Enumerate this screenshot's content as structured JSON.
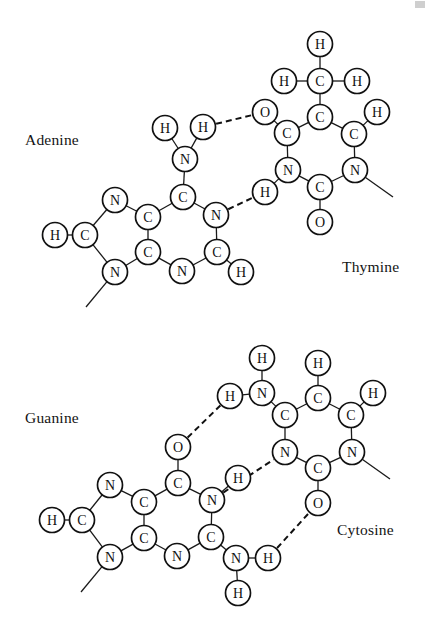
{
  "figure": {
    "background_color": "#ffffff",
    "atom_color": "#111111",
    "bond_color": "#1a1a1a",
    "width": 428,
    "height": 621
  },
  "labels": [
    {
      "id": "adenine-label",
      "text": "Adenine",
      "x": 25,
      "y": 131
    },
    {
      "id": "thymine-label",
      "text": "Thymine",
      "x": 342,
      "y": 258
    },
    {
      "id": "guanine-label",
      "text": "Guanine",
      "x": 25,
      "y": 409
    },
    {
      "id": "cytosine-label",
      "text": "Cytosine",
      "x": 337,
      "y": 521
    }
  ],
  "pairs": [
    {
      "id": "adenine-thymine",
      "name": "Adenine-Thymine base pair",
      "left_base": "Adenine",
      "right_base": "Thymine",
      "hydrogen_bonds": 2
    },
    {
      "id": "guanine-cytosine",
      "name": "Guanine-Cytosine base pair",
      "left_base": "Guanine",
      "right_base": "Cytosine",
      "hydrogen_bonds": 3
    }
  ],
  "chart_data": {
    "type": "diagram",
    "atoms": [
      {
        "id": "a_h8",
        "element": "H",
        "x": 55,
        "y": 235,
        "base": "adenine"
      },
      {
        "id": "a_c8",
        "element": "C",
        "x": 85,
        "y": 235,
        "base": "adenine"
      },
      {
        "id": "a_n7",
        "element": "N",
        "x": 115,
        "y": 200,
        "base": "adenine"
      },
      {
        "id": "a_n9",
        "element": "N",
        "x": 115,
        "y": 272,
        "base": "adenine"
      },
      {
        "id": "a_c5",
        "element": "C",
        "x": 148,
        "y": 217,
        "base": "adenine"
      },
      {
        "id": "a_c4",
        "element": "C",
        "x": 148,
        "y": 252,
        "base": "adenine"
      },
      {
        "id": "a_c6",
        "element": "C",
        "x": 183,
        "y": 197,
        "base": "adenine"
      },
      {
        "id": "a_n1",
        "element": "N",
        "x": 216,
        "y": 215,
        "base": "adenine"
      },
      {
        "id": "a_c2",
        "element": "C",
        "x": 217,
        "y": 252,
        "base": "adenine"
      },
      {
        "id": "a_n3",
        "element": "N",
        "x": 182,
        "y": 271,
        "base": "adenine"
      },
      {
        "id": "a_h2",
        "element": "H",
        "x": 241,
        "y": 272,
        "base": "adenine"
      },
      {
        "id": "a_n6",
        "element": "N",
        "x": 185,
        "y": 159,
        "base": "adenine"
      },
      {
        "id": "a_h6a",
        "element": "H",
        "x": 165,
        "y": 128,
        "base": "adenine"
      },
      {
        "id": "a_h6b",
        "element": "H",
        "x": 203,
        "y": 127,
        "base": "adenine"
      },
      {
        "id": "t_hme",
        "element": "H",
        "x": 320,
        "y": 44,
        "base": "thymine"
      },
      {
        "id": "t_cme",
        "element": "C",
        "x": 320,
        "y": 81,
        "base": "thymine"
      },
      {
        "id": "t_hml",
        "element": "H",
        "x": 284,
        "y": 81,
        "base": "thymine"
      },
      {
        "id": "t_hmr",
        "element": "H",
        "x": 357,
        "y": 81,
        "base": "thymine"
      },
      {
        "id": "t_c5",
        "element": "C",
        "x": 320,
        "y": 117,
        "base": "thymine"
      },
      {
        "id": "t_c4",
        "element": "C",
        "x": 287,
        "y": 133,
        "base": "thymine"
      },
      {
        "id": "t_o4",
        "element": "O",
        "x": 265,
        "y": 112,
        "base": "thymine"
      },
      {
        "id": "t_n3",
        "element": "N",
        "x": 288,
        "y": 170,
        "base": "thymine"
      },
      {
        "id": "t_h3",
        "element": "H",
        "x": 265,
        "y": 192,
        "base": "thymine"
      },
      {
        "id": "t_c2",
        "element": "C",
        "x": 320,
        "y": 187,
        "base": "thymine"
      },
      {
        "id": "t_o2",
        "element": "O",
        "x": 320,
        "y": 222,
        "base": "thymine"
      },
      {
        "id": "t_n1",
        "element": "N",
        "x": 355,
        "y": 170,
        "base": "thymine"
      },
      {
        "id": "t_c6",
        "element": "C",
        "x": 354,
        "y": 134,
        "base": "thymine"
      },
      {
        "id": "t_h6",
        "element": "H",
        "x": 377,
        "y": 112,
        "base": "thymine"
      },
      {
        "id": "g_h8",
        "element": "H",
        "x": 52,
        "y": 520,
        "base": "guanine"
      },
      {
        "id": "g_c8",
        "element": "C",
        "x": 82,
        "y": 520,
        "base": "guanine"
      },
      {
        "id": "g_n7",
        "element": "N",
        "x": 110,
        "y": 485,
        "base": "guanine"
      },
      {
        "id": "g_n9",
        "element": "N",
        "x": 110,
        "y": 557,
        "base": "guanine"
      },
      {
        "id": "g_c5",
        "element": "C",
        "x": 144,
        "y": 502,
        "base": "guanine"
      },
      {
        "id": "g_c4",
        "element": "C",
        "x": 144,
        "y": 538,
        "base": "guanine"
      },
      {
        "id": "g_c6",
        "element": "C",
        "x": 178,
        "y": 483,
        "base": "guanine"
      },
      {
        "id": "g_o6",
        "element": "O",
        "x": 178,
        "y": 447,
        "base": "guanine"
      },
      {
        "id": "g_n1",
        "element": "N",
        "x": 212,
        "y": 500,
        "base": "guanine"
      },
      {
        "id": "g_h1",
        "element": "H",
        "x": 238,
        "y": 478,
        "base": "guanine"
      },
      {
        "id": "g_c2",
        "element": "C",
        "x": 211,
        "y": 537,
        "base": "guanine"
      },
      {
        "id": "g_n3",
        "element": "N",
        "x": 177,
        "y": 556,
        "base": "guanine"
      },
      {
        "id": "g_n2",
        "element": "N",
        "x": 236,
        "y": 558,
        "base": "guanine"
      },
      {
        "id": "g_h2a",
        "element": "H",
        "x": 268,
        "y": 558,
        "base": "guanine"
      },
      {
        "id": "g_h2b",
        "element": "H",
        "x": 238,
        "y": 593,
        "base": "guanine"
      },
      {
        "id": "c_h4a",
        "element": "H",
        "x": 230,
        "y": 396,
        "base": "cytosine"
      },
      {
        "id": "c_n4",
        "element": "N",
        "x": 262,
        "y": 393,
        "base": "cytosine"
      },
      {
        "id": "c_h4b",
        "element": "H",
        "x": 262,
        "y": 358,
        "base": "cytosine"
      },
      {
        "id": "c_c4",
        "element": "C",
        "x": 285,
        "y": 415,
        "base": "cytosine"
      },
      {
        "id": "c_c5",
        "element": "C",
        "x": 318,
        "y": 398,
        "base": "cytosine"
      },
      {
        "id": "c_h5",
        "element": "H",
        "x": 318,
        "y": 363,
        "base": "cytosine"
      },
      {
        "id": "c_c6",
        "element": "C",
        "x": 351,
        "y": 415,
        "base": "cytosine"
      },
      {
        "id": "c_h6",
        "element": "H",
        "x": 373,
        "y": 393,
        "base": "cytosine"
      },
      {
        "id": "c_n1",
        "element": "N",
        "x": 352,
        "y": 452,
        "base": "cytosine"
      },
      {
        "id": "c_n3",
        "element": "N",
        "x": 285,
        "y": 452,
        "base": "cytosine"
      },
      {
        "id": "c_c2",
        "element": "C",
        "x": 318,
        "y": 468,
        "base": "cytosine"
      },
      {
        "id": "c_o2",
        "element": "O",
        "x": 318,
        "y": 503,
        "base": "cytosine"
      }
    ],
    "bonds": [
      {
        "from": "a_h8",
        "to": "a_c8"
      },
      {
        "from": "a_c8",
        "to": "a_n7"
      },
      {
        "from": "a_c8",
        "to": "a_n9"
      },
      {
        "from": "a_n7",
        "to": "a_c5"
      },
      {
        "from": "a_n9",
        "to": "a_c4"
      },
      {
        "from": "a_c5",
        "to": "a_c4"
      },
      {
        "from": "a_c5",
        "to": "a_c6"
      },
      {
        "from": "a_c6",
        "to": "a_n1"
      },
      {
        "from": "a_n1",
        "to": "a_c2"
      },
      {
        "from": "a_c2",
        "to": "a_n3"
      },
      {
        "from": "a_n3",
        "to": "a_c4"
      },
      {
        "from": "a_c2",
        "to": "a_h2"
      },
      {
        "from": "a_c6",
        "to": "a_n6"
      },
      {
        "from": "a_n6",
        "to": "a_h6a"
      },
      {
        "from": "a_n6",
        "to": "a_h6b"
      },
      {
        "from": "t_hme",
        "to": "t_cme"
      },
      {
        "from": "t_hml",
        "to": "t_cme"
      },
      {
        "from": "t_hmr",
        "to": "t_cme"
      },
      {
        "from": "t_cme",
        "to": "t_c5"
      },
      {
        "from": "t_c5",
        "to": "t_c4"
      },
      {
        "from": "t_c4",
        "to": "t_o4"
      },
      {
        "from": "t_c4",
        "to": "t_n3"
      },
      {
        "from": "t_n3",
        "to": "t_h3"
      },
      {
        "from": "t_n3",
        "to": "t_c2"
      },
      {
        "from": "t_c2",
        "to": "t_o2"
      },
      {
        "from": "t_c2",
        "to": "t_n1"
      },
      {
        "from": "t_n1",
        "to": "t_c6"
      },
      {
        "from": "t_c6",
        "to": "t_c5"
      },
      {
        "from": "t_c6",
        "to": "t_h6"
      },
      {
        "from": "g_h8",
        "to": "g_c8"
      },
      {
        "from": "g_c8",
        "to": "g_n7"
      },
      {
        "from": "g_c8",
        "to": "g_n9"
      },
      {
        "from": "g_n7",
        "to": "g_c5"
      },
      {
        "from": "g_n9",
        "to": "g_c4"
      },
      {
        "from": "g_c5",
        "to": "g_c4"
      },
      {
        "from": "g_c5",
        "to": "g_c6"
      },
      {
        "from": "g_c6",
        "to": "g_o6"
      },
      {
        "from": "g_c6",
        "to": "g_n1"
      },
      {
        "from": "g_n1",
        "to": "g_h1"
      },
      {
        "from": "g_n1",
        "to": "g_c2"
      },
      {
        "from": "g_c2",
        "to": "g_n3"
      },
      {
        "from": "g_n3",
        "to": "g_c4"
      },
      {
        "from": "g_c2",
        "to": "g_n2"
      },
      {
        "from": "g_n2",
        "to": "g_h2a"
      },
      {
        "from": "g_n2",
        "to": "g_h2b"
      },
      {
        "from": "c_h4a",
        "to": "c_n4"
      },
      {
        "from": "c_n4",
        "to": "c_h4b"
      },
      {
        "from": "c_n4",
        "to": "c_c4"
      },
      {
        "from": "c_c4",
        "to": "c_c5"
      },
      {
        "from": "c_c5",
        "to": "c_h5"
      },
      {
        "from": "c_c5",
        "to": "c_c6"
      },
      {
        "from": "c_c6",
        "to": "c_h6"
      },
      {
        "from": "c_c6",
        "to": "c_n1"
      },
      {
        "from": "c_n1",
        "to": "c_c2"
      },
      {
        "from": "c_c2",
        "to": "c_n3"
      },
      {
        "from": "c_n3",
        "to": "c_c4"
      },
      {
        "from": "c_c2",
        "to": "c_o2"
      }
    ],
    "hydrogen_bonds": [
      {
        "from": "a_h6b",
        "to": "t_o4",
        "pair": "adenine-thymine"
      },
      {
        "from": "a_n1",
        "to": "t_h3",
        "pair": "adenine-thymine"
      },
      {
        "from": "g_o6",
        "to": "c_h4a",
        "pair": "guanine-cytosine"
      },
      {
        "from": "g_n1",
        "to": "c_n3",
        "pair": "guanine-cytosine"
      },
      {
        "from": "g_h2a",
        "to": "c_o2",
        "pair": "guanine-cytosine"
      }
    ],
    "sugar_stubs": [
      {
        "from": "a_n9",
        "x2": 86,
        "y2": 307,
        "base": "adenine"
      },
      {
        "from": "t_n1",
        "x2": 393,
        "y2": 197,
        "base": "thymine"
      },
      {
        "from": "g_n9",
        "x2": 81,
        "y2": 592,
        "base": "guanine"
      },
      {
        "from": "c_n1",
        "x2": 390,
        "y2": 479,
        "base": "cytosine"
      }
    ]
  }
}
